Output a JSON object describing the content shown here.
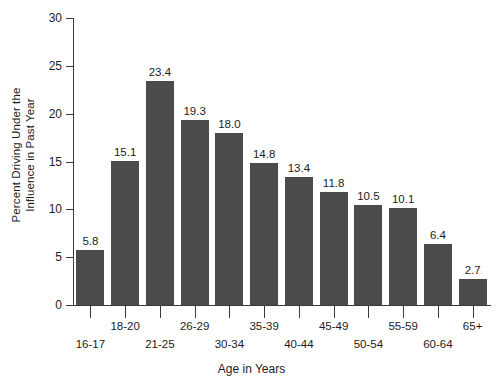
{
  "chart_data": {
    "type": "bar",
    "title": "",
    "xlabel": "Age in Years",
    "ylabel": "Percent Driving Under the Influence in Past Year",
    "ylabel_lines": [
      "Percent Driving Under the",
      "Influence in Past Year"
    ],
    "categories": [
      "16-17",
      "18-20",
      "21-25",
      "26-29",
      "30-34",
      "35-39",
      "40-44",
      "45-49",
      "50-54",
      "55-59",
      "60-64",
      "65+"
    ],
    "values": [
      5.8,
      15.1,
      23.4,
      19.3,
      18.0,
      14.8,
      13.4,
      11.8,
      10.5,
      10.1,
      6.4,
      2.7
    ],
    "value_labels": [
      "5.8",
      "15.1",
      "23.4",
      "19.3",
      "18.0",
      "14.8",
      "13.4",
      "11.8",
      "10.5",
      "10.1",
      "6.4",
      "2.7"
    ],
    "ylim": [
      0,
      30
    ],
    "ytick_values": [
      0,
      5,
      10,
      15,
      20,
      25,
      30
    ],
    "ytick_labels": [
      "0",
      "5",
      "10",
      "15",
      "20",
      "25",
      "30"
    ],
    "grid": false,
    "legend": "none",
    "xtick_label_stagger": [
      "lower",
      "upper",
      "lower",
      "upper",
      "lower",
      "upper",
      "lower",
      "upper",
      "lower",
      "upper",
      "lower",
      "upper"
    ],
    "bar_color": "#4b4b4b",
    "axis_color": "#3a3a3a",
    "background_color": "#ffffff"
  }
}
